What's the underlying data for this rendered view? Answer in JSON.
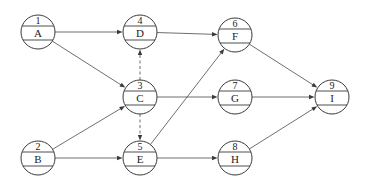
{
  "diagram": {
    "type": "activity-on-node network",
    "nodes": [
      {
        "id": "1",
        "number": "1",
        "label": "A"
      },
      {
        "id": "2",
        "number": "2",
        "label": "B"
      },
      {
        "id": "3",
        "number": "3",
        "label": "C"
      },
      {
        "id": "4",
        "number": "4",
        "label": "D"
      },
      {
        "id": "5",
        "number": "5",
        "label": "E"
      },
      {
        "id": "6",
        "number": "6",
        "label": "F"
      },
      {
        "id": "7",
        "number": "7",
        "label": "G"
      },
      {
        "id": "8",
        "number": "8",
        "label": "H"
      },
      {
        "id": "9",
        "number": "9",
        "label": "I"
      }
    ],
    "edges": [
      {
        "from": "1",
        "to": "4",
        "style": "solid"
      },
      {
        "from": "1",
        "to": "3",
        "style": "solid"
      },
      {
        "from": "2",
        "to": "3",
        "style": "solid"
      },
      {
        "from": "2",
        "to": "5",
        "style": "solid"
      },
      {
        "from": "3",
        "to": "4",
        "style": "dashed"
      },
      {
        "from": "3",
        "to": "5",
        "style": "dashed"
      },
      {
        "from": "3",
        "to": "7",
        "style": "solid"
      },
      {
        "from": "4",
        "to": "6",
        "style": "solid"
      },
      {
        "from": "5",
        "to": "6",
        "style": "solid"
      },
      {
        "from": "5",
        "to": "8",
        "style": "solid"
      },
      {
        "from": "6",
        "to": "9",
        "style": "solid"
      },
      {
        "from": "7",
        "to": "9",
        "style": "solid"
      },
      {
        "from": "8",
        "to": "9",
        "style": "solid"
      }
    ]
  }
}
